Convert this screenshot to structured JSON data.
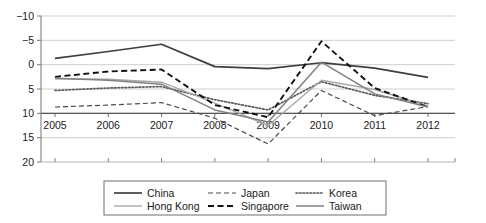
{
  "chart_data": {
    "type": "line",
    "title": "",
    "subtitle": "",
    "xlabel": "",
    "ylabel": "",
    "categories": [
      "2005",
      "2006",
      "2007",
      "2008",
      "2009",
      "2010",
      "2011",
      "2012"
    ],
    "x": [
      2005,
      2006,
      2007,
      2008,
      2009,
      2010,
      2011,
      2012
    ],
    "ylim": [
      -10,
      20
    ],
    "yticks": [
      -10,
      -5,
      0,
      5,
      10,
      15,
      20
    ],
    "ytick_labels": [
      "−10",
      "−5",
      "0",
      "5",
      "10",
      "15",
      "20"
    ],
    "grid": true,
    "grid_axis": "y",
    "legend_position": "bottom",
    "series": [
      {
        "name": "China",
        "style": "solid",
        "color": "#3f3f3f",
        "width": 1.7,
        "values": [
          11.3,
          12.7,
          14.2,
          9.6,
          9.2,
          10.4,
          9.3,
          7.4
        ]
      },
      {
        "name": "Japan",
        "style": "dashed-long",
        "color": "#4a4a4a",
        "width": 1.2,
        "values": [
          1.3,
          1.7,
          2.2,
          -1.0,
          -6.3,
          4.7,
          -0.5,
          1.4
        ]
      },
      {
        "name": "Korea",
        "style": "dotted",
        "color": "#5a5a5a",
        "width": 1.7,
        "values": [
          4.7,
          5.2,
          5.5,
          2.8,
          0.7,
          6.5,
          3.7,
          2.0
        ]
      },
      {
        "name": "Hong Kong",
        "style": "solid-light",
        "color": "#a8a8a8",
        "width": 1.4,
        "values": [
          7.1,
          7.0,
          6.4,
          2.1,
          -2.5,
          6.8,
          4.9,
          1.5
        ]
      },
      {
        "name": "Singapore",
        "style": "dashed-heavy",
        "color": "#111111",
        "width": 1.9,
        "values": [
          7.5,
          8.6,
          9.0,
          1.7,
          -0.8,
          14.8,
          5.2,
          1.3
        ]
      },
      {
        "name": "Taiwan",
        "style": "solid-gray",
        "color": "#808080",
        "width": 1.5,
        "values": [
          7.2,
          6.8,
          6.0,
          0.7,
          -1.8,
          10.5,
          4.0,
          1.3
        ]
      }
    ]
  },
  "legend": {
    "items": [
      {
        "label": "China",
        "key": "china"
      },
      {
        "label": "Japan",
        "key": "japan"
      },
      {
        "label": "Korea",
        "key": "korea"
      },
      {
        "label": "Hong Kong",
        "key": "hong-kong"
      },
      {
        "label": "Singapore",
        "key": "singapore"
      },
      {
        "label": "Taiwan",
        "key": "taiwan"
      }
    ]
  },
  "axes": {
    "y_labels": [
      "20",
      "15",
      "10",
      "5",
      "0",
      "−5",
      "−10"
    ],
    "x_labels": [
      "2005",
      "2006",
      "2007",
      "2008",
      "2009",
      "2010",
      "2011",
      "2012"
    ]
  },
  "colors": {
    "background": "#ffffff",
    "grid": "#c9c9c9",
    "axis": "#808080",
    "text": "#1a1a1a",
    "legend_border": "#6e6e6e"
  }
}
